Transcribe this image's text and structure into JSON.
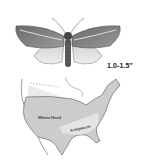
{
  "illustration": {
    "subject": "moth-icon",
    "size_label": "1.0-1.5\""
  },
  "map": {
    "region": "North America (USA)",
    "labels": {
      "wheat_head": "Wheat Head",
      "armyworm": "Armyworm"
    },
    "colors": {
      "land": "#d8d8d8",
      "hatched_range": "#b8b8b8",
      "outline": "#555555",
      "background": "#ffffff"
    }
  }
}
